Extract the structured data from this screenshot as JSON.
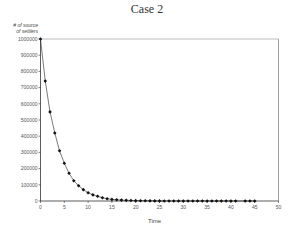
{
  "chart_data": {
    "type": "line",
    "title": "Case 2",
    "xlabel": "Time",
    "ylabel": "# of source of settlers",
    "xlim": [
      0,
      50
    ],
    "ylim": [
      0,
      1000000
    ],
    "xticks": [
      0,
      5,
      10,
      15,
      20,
      25,
      30,
      35,
      40,
      45,
      50
    ],
    "yticks": [
      0,
      100000,
      200000,
      300000,
      400000,
      500000,
      600000,
      700000,
      800000,
      900000,
      1000000
    ],
    "grid": false,
    "legend": null,
    "marker": "diamond",
    "series": [
      {
        "name": "# of source of settlers",
        "x": [
          0,
          1,
          2,
          3,
          4,
          5,
          6,
          7,
          8,
          9,
          10,
          11,
          12,
          13,
          14,
          15,
          16,
          17,
          18,
          19,
          20,
          21,
          22,
          23,
          24,
          25,
          26,
          27,
          28,
          29,
          30,
          31,
          32,
          33,
          34,
          35,
          36,
          37,
          38,
          39,
          40,
          41,
          43,
          44,
          45
        ],
        "values": [
          1000000,
          740000,
          550000,
          420000,
          310000,
          233000,
          171000,
          125000,
          94000,
          70000,
          51000,
          38000,
          29000,
          20000,
          14000,
          10000,
          7500,
          5500,
          4000,
          3000,
          2200,
          1600,
          1200,
          900,
          650,
          480,
          360,
          260,
          190,
          140,
          100,
          80,
          60,
          40,
          30,
          20,
          15,
          11,
          8,
          6,
          4,
          3,
          2,
          1,
          1
        ]
      }
    ]
  },
  "title": "Case 2",
  "axes": {
    "ylabel_line1": "# of source",
    "ylabel_line2": "of settlers",
    "xlabel": "Time"
  }
}
